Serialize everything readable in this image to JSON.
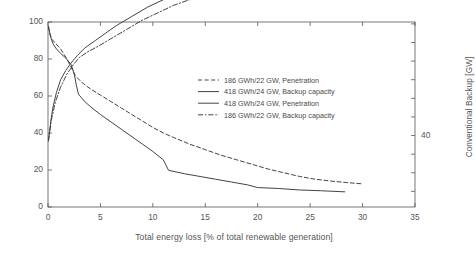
{
  "chart_data": {
    "type": "line",
    "title": "",
    "xlabel": "Total energy loss [% of total renewable generation]",
    "ylabel": "Penetration [% of annual demand]",
    "ylabel_right": "Conventional Backup [GW]",
    "xlim": [
      0,
      35
    ],
    "ylim": [
      0,
      100
    ],
    "ylim_right": [
      20.8,
      70.5
    ],
    "xticks": [
      0,
      5,
      10,
      15,
      20,
      25,
      30,
      35
    ],
    "xticklabels": [
      "0",
      "5",
      "10",
      "15",
      "20",
      "25",
      "30",
      "35"
    ],
    "yticks": [
      0,
      20,
      40,
      60,
      80,
      100
    ],
    "yticklabels": [
      "0",
      "20",
      "40",
      "60",
      "80",
      "100"
    ],
    "yticks_right": [
      40
    ],
    "yticklabels_right": [
      "40"
    ],
    "grid": false,
    "legend_position": "center-right-inside",
    "series": [
      {
        "name": "186 GWh/22 GW, Penetration",
        "style": "dashed",
        "axis": "left",
        "color": "#3a3a3a",
        "points": [
          [
            0.05,
            97.5
          ],
          [
            0.2,
            93.0
          ],
          [
            0.4,
            90.5
          ],
          [
            0.7,
            88.5
          ],
          [
            1.2,
            85.5
          ],
          [
            1.8,
            80.0
          ],
          [
            2.3,
            74.5
          ],
          [
            2.6,
            71.0
          ],
          [
            3.2,
            67.5
          ],
          [
            4.0,
            64.0
          ],
          [
            5.0,
            60.5
          ],
          [
            6.0,
            57.0
          ],
          [
            7.0,
            53.5
          ],
          [
            8.0,
            50.0
          ],
          [
            9.0,
            46.5
          ],
          [
            10.0,
            43.0
          ],
          [
            11.0,
            40.0
          ],
          [
            12.0,
            37.5
          ],
          [
            13.5,
            34.0
          ],
          [
            15.0,
            31.0
          ],
          [
            16.5,
            28.0
          ],
          [
            18.0,
            25.5
          ],
          [
            19.5,
            23.0
          ],
          [
            21.0,
            20.5
          ],
          [
            22.5,
            18.5
          ],
          [
            24.0,
            16.5
          ],
          [
            25.5,
            15.0
          ],
          [
            27.0,
            14.0
          ],
          [
            28.5,
            13.2
          ],
          [
            30.0,
            12.5
          ]
        ]
      },
      {
        "name": "418 GWh/24 GW, Backup capacity",
        "style": "solid",
        "axis": "right",
        "color": "#3a3a3a",
        "points": [
          [
            0.05,
            39.0
          ],
          [
            0.15,
            41.0
          ],
          [
            0.3,
            44.5
          ],
          [
            0.5,
            48.0
          ],
          [
            0.8,
            51.5
          ],
          [
            1.2,
            55.0
          ],
          [
            1.7,
            57.5
          ],
          [
            2.2,
            59.5
          ],
          [
            2.8,
            61.5
          ],
          [
            3.5,
            63.5
          ],
          [
            4.5,
            65.5
          ],
          [
            5.5,
            67.5
          ],
          [
            6.5,
            69.5
          ],
          [
            8.0,
            72.0
          ],
          [
            9.5,
            74.5
          ],
          [
            11.0,
            76.5
          ],
          [
            12.5,
            78.5
          ],
          [
            14.0,
            80.0
          ],
          [
            16.0,
            82.0
          ],
          [
            18.0,
            83.5
          ],
          [
            20.0,
            85.0
          ],
          [
            22.0,
            86.5
          ],
          [
            24.0,
            87.8
          ],
          [
            26.0,
            88.8
          ],
          [
            28.0,
            89.8
          ],
          [
            30.0,
            90.5
          ]
        ]
      },
      {
        "name": "418 GWh/24 GW, Penetration",
        "style": "solid",
        "axis": "left",
        "color": "#3a3a3a",
        "points": [
          [
            0.05,
            97.5
          ],
          [
            0.15,
            94.5
          ],
          [
            0.3,
            91.0
          ],
          [
            0.5,
            88.0
          ],
          [
            0.8,
            85.5
          ],
          [
            1.2,
            83.0
          ],
          [
            1.7,
            80.5
          ],
          [
            2.2,
            77.0
          ],
          [
            2.5,
            72.0
          ],
          [
            2.7,
            66.0
          ],
          [
            2.9,
            61.0
          ],
          [
            3.5,
            57.0
          ],
          [
            4.2,
            53.5
          ],
          [
            5.0,
            50.0
          ],
          [
            6.0,
            46.0
          ],
          [
            7.0,
            42.0
          ],
          [
            8.0,
            38.0
          ],
          [
            9.0,
            34.0
          ],
          [
            10.0,
            30.0
          ],
          [
            11.0,
            25.5
          ],
          [
            11.5,
            19.8
          ],
          [
            13.0,
            18.0
          ],
          [
            14.5,
            16.5
          ],
          [
            16.0,
            15.0
          ],
          [
            17.5,
            13.5
          ],
          [
            19.0,
            12.0
          ],
          [
            20.0,
            10.5
          ],
          [
            22.0,
            10.0
          ],
          [
            24.0,
            9.2
          ],
          [
            26.0,
            8.8
          ],
          [
            28.3,
            8.2
          ]
        ]
      },
      {
        "name": "186 GWh/22 GW, Backup capacity",
        "style": "dashdot",
        "axis": "right",
        "color": "#3a3a3a",
        "points": [
          [
            0.05,
            38.5
          ],
          [
            0.3,
            44.0
          ],
          [
            0.7,
            49.0
          ],
          [
            1.2,
            53.0
          ],
          [
            1.8,
            56.5
          ],
          [
            2.4,
            59.0
          ],
          [
            3.0,
            61.0
          ],
          [
            3.8,
            62.5
          ],
          [
            4.8,
            64.0
          ],
          [
            6.0,
            66.0
          ],
          [
            7.5,
            68.5
          ],
          [
            9.0,
            71.0
          ],
          [
            10.5,
            73.0
          ],
          [
            12.0,
            75.0
          ],
          [
            14.0,
            77.0
          ],
          [
            16.0,
            79.0
          ],
          [
            18.0,
            80.8
          ],
          [
            20.0,
            82.2
          ],
          [
            22.0,
            83.8
          ],
          [
            24.0,
            85.0
          ],
          [
            26.0,
            86.2
          ],
          [
            28.0,
            87.2
          ],
          [
            30.0,
            88.0
          ]
        ]
      }
    ]
  },
  "legend": {
    "items": [
      {
        "label": "186 GWh/22 GW, Penetration",
        "style": "dashed"
      },
      {
        "label": "418 GWh/24 GW, Backup capacity",
        "style": "solid"
      },
      {
        "label": "418 GWh/24 GW, Penetration",
        "style": "solid"
      },
      {
        "label": "186 GWh/22 GW, Backup capacity",
        "style": "dashdot"
      }
    ]
  }
}
